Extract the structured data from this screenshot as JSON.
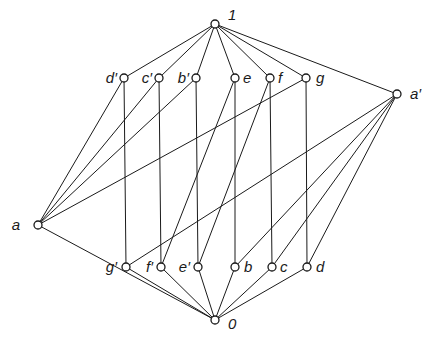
{
  "diagram": {
    "type": "lattice-hasse-diagram",
    "colors": {
      "line": "#1a1a1a",
      "node_fill": "#ffffff",
      "background": "#ffffff"
    },
    "nodes": [
      {
        "id": "1",
        "label": "1",
        "x": 215,
        "y": 24,
        "lx": 228,
        "ly": 20,
        "anchor": "start"
      },
      {
        "id": "d'",
        "label": "d′",
        "x": 124,
        "y": 78,
        "lx": 117,
        "ly": 83,
        "anchor": "end"
      },
      {
        "id": "c'",
        "label": "c′",
        "x": 159,
        "y": 78,
        "lx": 152,
        "ly": 83,
        "anchor": "end"
      },
      {
        "id": "b'",
        "label": "b′",
        "x": 196,
        "y": 78,
        "lx": 189,
        "ly": 83,
        "anchor": "end"
      },
      {
        "id": "e",
        "label": "e",
        "x": 235,
        "y": 78,
        "lx": 243,
        "ly": 83,
        "anchor": "start"
      },
      {
        "id": "f",
        "label": "f",
        "x": 270,
        "y": 78,
        "lx": 278,
        "ly": 83,
        "anchor": "start"
      },
      {
        "id": "g",
        "label": "g",
        "x": 306,
        "y": 78,
        "lx": 316,
        "ly": 83,
        "anchor": "start"
      },
      {
        "id": "a'",
        "label": "a′",
        "x": 397,
        "y": 94,
        "lx": 410,
        "ly": 99,
        "anchor": "start"
      },
      {
        "id": "a",
        "label": "a",
        "x": 38,
        "y": 225,
        "lx": 20,
        "ly": 230,
        "anchor": "end"
      },
      {
        "id": "g'",
        "label": "g′",
        "x": 126,
        "y": 267,
        "lx": 117,
        "ly": 272,
        "anchor": "end"
      },
      {
        "id": "f'",
        "label": "f′",
        "x": 161,
        "y": 267,
        "lx": 153,
        "ly": 272,
        "anchor": "end"
      },
      {
        "id": "e'",
        "label": "e′",
        "x": 198,
        "y": 267,
        "lx": 190,
        "ly": 272,
        "anchor": "end"
      },
      {
        "id": "b",
        "label": "b",
        "x": 235,
        "y": 267,
        "lx": 244,
        "ly": 272,
        "anchor": "start"
      },
      {
        "id": "c",
        "label": "c",
        "x": 272,
        "y": 267,
        "lx": 280,
        "ly": 272,
        "anchor": "start"
      },
      {
        "id": "d",
        "label": "d",
        "x": 307,
        "y": 267,
        "lx": 316,
        "ly": 272,
        "anchor": "start"
      },
      {
        "id": "0",
        "label": "0",
        "x": 215,
        "y": 320,
        "lx": 228,
        "ly": 329,
        "anchor": "start"
      }
    ],
    "edges": [
      [
        "1",
        "d'"
      ],
      [
        "1",
        "c'"
      ],
      [
        "1",
        "b'"
      ],
      [
        "1",
        "e"
      ],
      [
        "1",
        "f"
      ],
      [
        "1",
        "g"
      ],
      [
        "1",
        "a'"
      ],
      [
        "d'",
        "g'"
      ],
      [
        "c'",
        "f'"
      ],
      [
        "b'",
        "e'"
      ],
      [
        "e",
        "b"
      ],
      [
        "f",
        "c"
      ],
      [
        "g",
        "d"
      ],
      [
        "a",
        "d'"
      ],
      [
        "a",
        "c'"
      ],
      [
        "a",
        "b'"
      ],
      [
        "a",
        "g"
      ],
      [
        "a'",
        "g'"
      ],
      [
        "a'",
        "b"
      ],
      [
        "a'",
        "c"
      ],
      [
        "a'",
        "d"
      ],
      [
        "e",
        "f'"
      ],
      [
        "f",
        "e'"
      ],
      [
        "0",
        "g'"
      ],
      [
        "0",
        "f'"
      ],
      [
        "0",
        "e'"
      ],
      [
        "0",
        "b"
      ],
      [
        "0",
        "c"
      ],
      [
        "0",
        "d"
      ],
      [
        "0",
        "a"
      ]
    ]
  }
}
